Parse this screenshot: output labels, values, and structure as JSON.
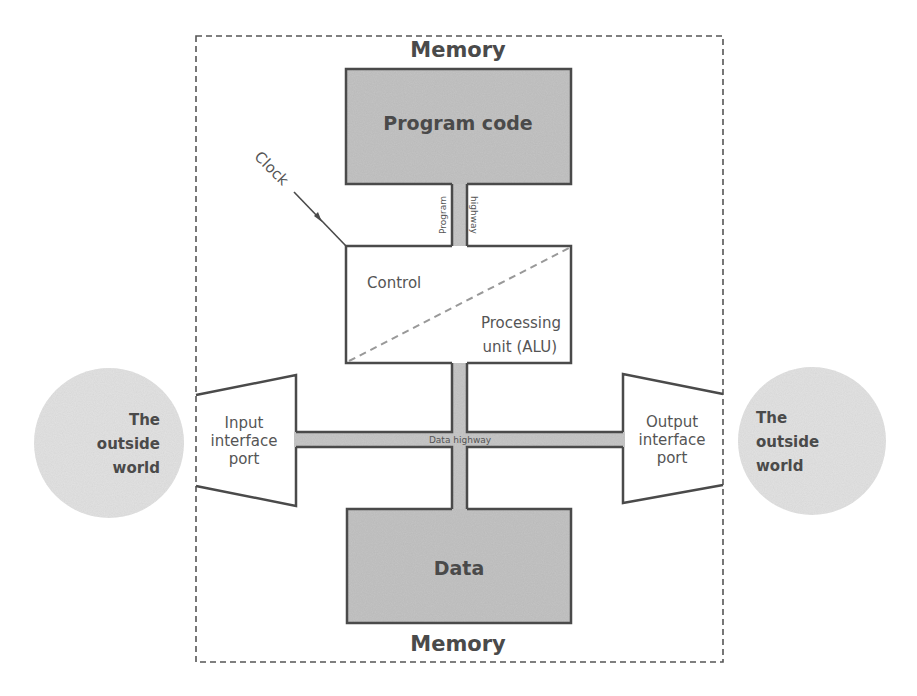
{
  "diagram": {
    "memory_top_label": "Memory",
    "memory_bottom_label": "Memory",
    "program_code_label": "Program code",
    "program_highway_left_label": "Program",
    "program_highway_right_label": "highway",
    "clock_label": "Clock",
    "control_label": "Control",
    "processing_label_line1": "Processing",
    "processing_label_line2": "unit (ALU)",
    "data_highway_label": "Data highway",
    "data_label": "Data",
    "input_port": {
      "line1": "Input",
      "line2": "interface",
      "line3": "port"
    },
    "output_port": {
      "line1": "Output",
      "line2": "interface",
      "line3": "port"
    },
    "outside_world_left": {
      "line1": "The",
      "line2": "outside",
      "line3": "world"
    },
    "outside_world_right": {
      "line1": "The",
      "line2": "outside",
      "line3": "world"
    }
  },
  "colors": {
    "box_fill": "#c4c4c4",
    "box_border": "#4a4a4a",
    "highway_fill": "#c8c8c8",
    "circle_fill": "#e3e3e3",
    "dashed_border": "#555555"
  }
}
